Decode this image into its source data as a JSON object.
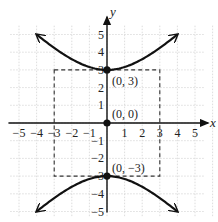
{
  "chart_data": {
    "type": "line",
    "title": "",
    "xlabel": "x",
    "ylabel": "y",
    "xlim": [
      -5,
      5
    ],
    "ylim": [
      -5,
      5
    ],
    "grid": true,
    "x_ticks": [
      -5,
      -4,
      -3,
      -2,
      -1,
      1,
      2,
      3,
      4,
      5
    ],
    "y_ticks": [
      -5,
      -4,
      -3,
      -2,
      -1,
      1,
      2,
      3,
      4,
      5
    ],
    "x_tick_labels": [
      "−5",
      "−4",
      "−3",
      "−2",
      "−1",
      "1",
      "2",
      "3",
      "4",
      "5"
    ],
    "y_tick_labels": [
      "−5",
      "−4",
      "−3",
      "−2",
      "−1",
      "1",
      "2",
      "3",
      "4",
      "5"
    ],
    "equation": "y^2/9 - x^2/9 = 1",
    "series": [
      {
        "name": "upper-branch",
        "x_range": [
          -4,
          4
        ],
        "formula": "y = sqrt(9 + x^2)",
        "arrows": "both-ends"
      },
      {
        "name": "lower-branch",
        "x_range": [
          -4,
          4
        ],
        "formula": "y = -sqrt(9 + x^2)",
        "arrows": "both-ends"
      }
    ],
    "points": [
      {
        "x": 0,
        "y": 3,
        "label": "(0, 3)"
      },
      {
        "x": 0,
        "y": 0,
        "label": "(0, 0)"
      },
      {
        "x": 0,
        "y": -3,
        "label": "(0, −3)"
      }
    ],
    "dashed_rectangle": {
      "x": [
        -3,
        3
      ],
      "y": [
        -3,
        3
      ]
    }
  }
}
